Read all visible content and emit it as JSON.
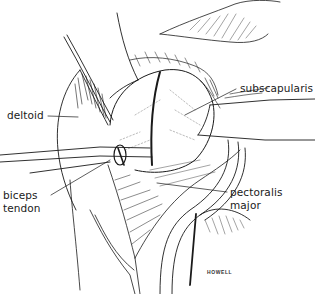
{
  "figure": {
    "type": "anatomical-line-illustration"
  },
  "labels": {
    "deltoid": "deltoid",
    "subscapularis": "subscapularis",
    "biceps_line1": "biceps",
    "biceps_line2": "tendon",
    "pectoralis_line1": "pectoralis",
    "pectoralis_line2": "major"
  },
  "signature": "HOWELL",
  "colors": {
    "ink": "#1a1a1a",
    "background": "#ffffff"
  }
}
